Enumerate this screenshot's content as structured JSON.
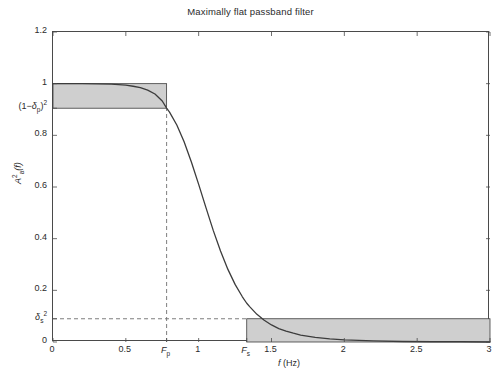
{
  "chart_data": {
    "type": "line",
    "title": "Maximally flat passband filter",
    "xlabel": "f (Hz)",
    "ylabel": "A_a^2(f)",
    "xlim": [
      0,
      3
    ],
    "ylim": [
      0,
      1.2
    ],
    "grid": false,
    "legend": "none",
    "xticks": [
      {
        "value": 0,
        "label": "0"
      },
      {
        "value": 0.5,
        "label": "0.5"
      },
      {
        "value": 1,
        "label": "1"
      },
      {
        "value": 1.5,
        "label": "1.5"
      },
      {
        "value": 2,
        "label": "2"
      },
      {
        "value": 2.5,
        "label": "2.5"
      },
      {
        "value": 3,
        "label": "3"
      }
    ],
    "yticks": [
      {
        "value": 0,
        "label": "0"
      },
      {
        "value": 0.2,
        "label": "0.2"
      },
      {
        "value": 0.4,
        "label": "0.4"
      },
      {
        "value": 0.6,
        "label": "0.6"
      },
      {
        "value": 0.8,
        "label": "0.8"
      },
      {
        "value": 1,
        "label": "1"
      },
      {
        "value": 1.2,
        "label": "1.2"
      }
    ],
    "special_xticks": [
      {
        "value": 0.78,
        "label": "Fp",
        "label_base": "F",
        "label_sub": "p"
      },
      {
        "value": 1.33,
        "label": "Fs",
        "label_base": "F",
        "label_sub": "s"
      }
    ],
    "special_yticks": [
      {
        "value": 0.905,
        "label": "(1-dp)^2"
      },
      {
        "value": 0.09,
        "label": "ds^2"
      }
    ],
    "series": [
      {
        "name": "A_a^2(f)",
        "color": "#3c3c3c",
        "x": [
          0.0,
          0.1,
          0.2,
          0.3,
          0.4,
          0.5,
          0.55,
          0.6,
          0.65,
          0.7,
          0.75,
          0.78,
          0.8,
          0.85,
          0.9,
          0.95,
          1.0,
          1.05,
          1.1,
          1.15,
          1.2,
          1.25,
          1.3,
          1.33,
          1.35,
          1.4,
          1.45,
          1.5,
          1.55,
          1.6,
          1.65,
          1.7,
          1.8,
          1.9,
          2.0,
          2.1,
          2.2,
          2.4,
          2.6,
          2.8,
          3.0
        ],
        "y": [
          1.0,
          1.0,
          1.0,
          0.999,
          0.998,
          0.994,
          0.99,
          0.985,
          0.975,
          0.96,
          0.933,
          0.905,
          0.89,
          0.84,
          0.775,
          0.697,
          0.61,
          0.52,
          0.432,
          0.352,
          0.282,
          0.223,
          0.175,
          0.15,
          0.137,
          0.107,
          0.084,
          0.066,
          0.052,
          0.042,
          0.034,
          0.027,
          0.018,
          0.012,
          0.008,
          0.006,
          0.004,
          0.002,
          0.001,
          0.001,
          0.0
        ]
      }
    ],
    "shaded_regions": [
      {
        "name": "passband-tolerance-box",
        "x0": 0.0,
        "x1": 0.78,
        "y0": 0.905,
        "y1": 1.0,
        "color": "#cfcfcf"
      },
      {
        "name": "stopband-tolerance-box",
        "x0": 1.33,
        "x1": 3.0,
        "y0": 0.0,
        "y1": 0.09,
        "color": "#cfcfcf"
      }
    ],
    "guide_lines": [
      {
        "name": "fp-vertical-dashed",
        "orientation": "vertical",
        "value": 0.78,
        "from": 0.0,
        "to": 0.905
      },
      {
        "name": "deltas-horizontal-dashed",
        "orientation": "horizontal",
        "value": 0.09,
        "from": 0.0,
        "to": 1.33
      }
    ],
    "colors": {
      "curve": "#3c3c3c",
      "shade": "#cfcfcf",
      "axis": "#4a4a4a",
      "dashed": "#6e6e6e",
      "text": "#2b2b2b",
      "background": "#ffffff"
    }
  },
  "labels": {
    "title": "Maximally flat passband filter",
    "xaxis_base": "f",
    "xaxis_unit": "(Hz)",
    "yaxis_base": "A",
    "yaxis_sup": "2",
    "yaxis_sub": "a",
    "yaxis_arg": "(f)",
    "fp_base": "F",
    "fp_sub": "p",
    "fs_base": "F",
    "fs_sub": "s",
    "deltap_open": "(1−",
    "deltap_sym": "δ",
    "deltap_sub": "p",
    "deltap_close": ")",
    "deltap_sup": "2",
    "deltas_sym": "δ",
    "deltas_sub": "s",
    "deltas_sup": "2",
    "ytick_0": "0",
    "ytick_02": "0.2",
    "ytick_04": "0.4",
    "ytick_06": "0.6",
    "ytick_08": "0.8",
    "ytick_1": "1",
    "ytick_12": "1.2",
    "xtick_0": "0",
    "xtick_05": "0.5",
    "xtick_1": "1",
    "xtick_15": "1.5",
    "xtick_2": "2",
    "xtick_25": "2.5",
    "xtick_3": "3"
  }
}
